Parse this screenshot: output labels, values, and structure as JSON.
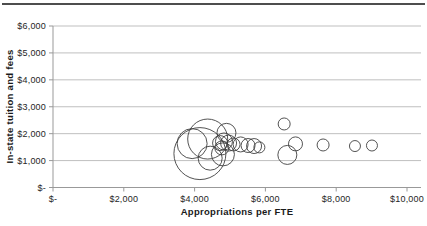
{
  "chart_data": {
    "type": "scatter",
    "subtype": "bubble",
    "title": "",
    "xlabel": "Appropriations per FTE",
    "ylabel": "In-state tuition and fees",
    "xlim": [
      0,
      10400
    ],
    "ylim": [
      0,
      6000
    ],
    "grid": "horizontal-only",
    "legend": "none",
    "x_ticks": [
      {
        "value": 0,
        "label": "$-"
      },
      {
        "value": 2000,
        "label": "$2,000"
      },
      {
        "value": 4000,
        "label": "$4,000"
      },
      {
        "value": 6000,
        "label": "$6,000"
      },
      {
        "value": 8000,
        "label": "$8,000"
      },
      {
        "value": 10000,
        "label": "$10,000"
      }
    ],
    "y_ticks": [
      {
        "value": 0,
        "label": "$-"
      },
      {
        "value": 1000,
        "label": "$1,000"
      },
      {
        "value": 2000,
        "label": "$2,000"
      },
      {
        "value": 3000,
        "label": "$3,000"
      },
      {
        "value": 4000,
        "label": "$4,000"
      },
      {
        "value": 5000,
        "label": "$5,000"
      },
      {
        "value": 6000,
        "label": "$6,000"
      }
    ],
    "points": [
      {
        "x": 4150,
        "y": 1260,
        "r": 26
      },
      {
        "x": 4370,
        "y": 1800,
        "r": 20
      },
      {
        "x": 3930,
        "y": 1630,
        "r": 15
      },
      {
        "x": 4440,
        "y": 1090,
        "r": 12
      },
      {
        "x": 4800,
        "y": 1230,
        "r": 11.5
      },
      {
        "x": 4900,
        "y": 2030,
        "r": 9.5
      },
      {
        "x": 4720,
        "y": 1650,
        "r": 7.5
      },
      {
        "x": 4830,
        "y": 1710,
        "r": 8.5
      },
      {
        "x": 4960,
        "y": 1650,
        "r": 8
      },
      {
        "x": 4770,
        "y": 1470,
        "r": 7
      },
      {
        "x": 5100,
        "y": 1600,
        "r": 6.5
      },
      {
        "x": 5300,
        "y": 1600,
        "r": 7.5
      },
      {
        "x": 5510,
        "y": 1560,
        "r": 7
      },
      {
        "x": 5680,
        "y": 1540,
        "r": 7.5
      },
      {
        "x": 5830,
        "y": 1490,
        "r": 5.5
      },
      {
        "x": 6530,
        "y": 2360,
        "r": 6
      },
      {
        "x": 6620,
        "y": 1210,
        "r": 9.5
      },
      {
        "x": 6850,
        "y": 1620,
        "r": 7
      },
      {
        "x": 7630,
        "y": 1580,
        "r": 6
      },
      {
        "x": 8530,
        "y": 1540,
        "r": 5.5
      },
      {
        "x": 9010,
        "y": 1560,
        "r": 5.5
      }
    ]
  },
  "colors": {
    "background": "#ffffff",
    "top_rule": "#4d4d4d",
    "grid": "#bfbfbf",
    "axis": "#999999",
    "tick": "#999999",
    "bubble_stroke": "#3f3f3f",
    "text": "#262626",
    "title_text": "#1a1a1a"
  }
}
